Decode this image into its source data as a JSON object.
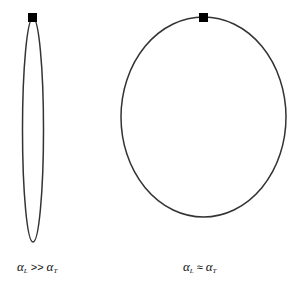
{
  "diagram": {
    "shapes": [
      {
        "name": "narrow-ellipse",
        "cx": 33,
        "cy": 130,
        "rx": 10.5,
        "ry": 112,
        "stroke": "#333333"
      },
      {
        "name": "wide-ellipse",
        "cx": 203.5,
        "cy": 117,
        "rx": 82.5,
        "ry": 100,
        "stroke": "#333333"
      }
    ],
    "markers": [
      {
        "name": "source-marker-left",
        "x": 32,
        "y": 18,
        "size": 8,
        "fill": "#000000"
      },
      {
        "name": "source-marker-right",
        "x": 203,
        "y": 18,
        "size": 8,
        "fill": "#000000"
      }
    ],
    "labels": {
      "left": {
        "lhs": "α",
        "lhs_sub": "L",
        "op": ">>",
        "rhs": "α",
        "rhs_sub": "T"
      },
      "right": {
        "lhs": "α",
        "lhs_sub": "L",
        "op": "≈",
        "rhs": "α",
        "rhs_sub": "T"
      }
    }
  }
}
